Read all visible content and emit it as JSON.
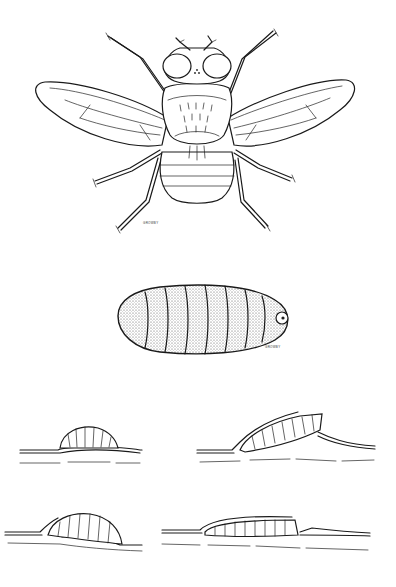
{
  "figure": {
    "panels": [
      {
        "id": "adult",
        "label": "Adult fly, dorsal view"
      },
      {
        "id": "larva",
        "label": "Larva / puparium, stippled"
      },
      {
        "id": "stage1",
        "label": "Larva emerging on leaf surface"
      },
      {
        "id": "stage2",
        "label": "Larva under lifted epidermis"
      },
      {
        "id": "stage3",
        "label": "Larva burrowing into leaf"
      },
      {
        "id": "stage4",
        "label": "Larva fully within leaf mine"
      }
    ],
    "signatures": {
      "adult": "GROWBY",
      "larva": "GROWBY"
    }
  },
  "colors": {
    "background": "#ffffff",
    "ink": "#1a1a1a"
  }
}
